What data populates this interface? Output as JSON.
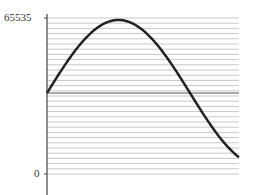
{
  "chart_data": {
    "type": "line",
    "title": "",
    "xlabel": "",
    "ylabel": "",
    "ylim": [
      0,
      65535
    ],
    "yticks": [
      0,
      65535
    ],
    "ytick_labels": [
      "0",
      "65535"
    ],
    "grid": "horizontal",
    "midline": 32768,
    "series": [
      {
        "name": "sine",
        "description": "one sine period starting at midline, peaking near max, ending near 0",
        "x": [
          0,
          0.125,
          0.25,
          0.375,
          0.5,
          0.625,
          0.75,
          0.875,
          1.0
        ],
        "values": [
          32768,
          53500,
          63500,
          58000,
          40000,
          23000,
          10000,
          3500,
          1500
        ]
      }
    ]
  },
  "axis": {
    "top_label": "65535",
    "bottom_label": "0"
  },
  "colors": {
    "curve": "#222222",
    "grid": "#c8c8c8",
    "axis": "#444444",
    "midline": "#555555"
  }
}
